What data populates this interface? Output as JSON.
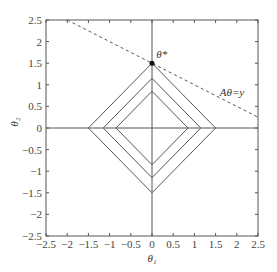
{
  "chart_data": {
    "type": "line",
    "title": "",
    "xlabel": "θ₁",
    "ylabel": "θ₂",
    "xlim": [
      -2.5,
      2.5
    ],
    "ylim": [
      -2.5,
      2.5
    ],
    "xticks": [
      "-2.5",
      "-2",
      "-1.5",
      "-1",
      "-0.5",
      "0",
      "0.5",
      "1",
      "1.5",
      "2",
      "2.5"
    ],
    "yticks": [
      "2.5",
      "2",
      "1.5",
      "1",
      "0.5",
      "0",
      "-0.5",
      "-1",
      "-1.5",
      "-2",
      "-2.5"
    ],
    "grid": false,
    "series": [
      {
        "name": "L1 contour outer",
        "style": "solid",
        "radius": 1.5
      },
      {
        "name": "L1 contour middle",
        "style": "solid",
        "radius": 1.15
      },
      {
        "name": "L1 contour inner",
        "style": "solid",
        "radius": 0.85
      },
      {
        "name": "constraint line",
        "style": "dashed",
        "x": [
          -2,
          2.5
        ],
        "y": [
          2.5,
          0.25
        ]
      }
    ],
    "points": [
      {
        "name": "θ*",
        "x": 0,
        "y": 1.5
      }
    ],
    "annotations": [
      {
        "text": "θ*",
        "x": 0.1,
        "y": 1.6
      },
      {
        "text": "Aθ=y",
        "x": 1.6,
        "y": 0.75
      }
    ]
  }
}
